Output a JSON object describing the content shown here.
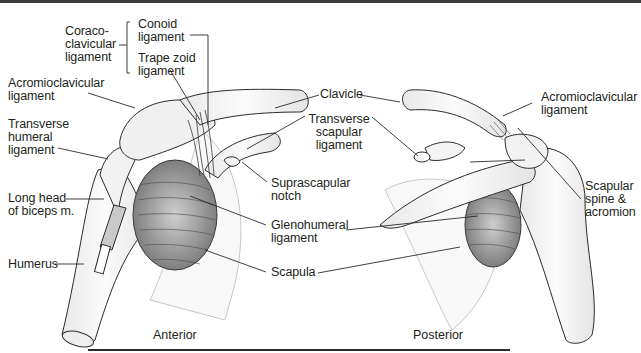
{
  "figure": {
    "views": [
      {
        "id": "anterior",
        "caption": "Anterior"
      },
      {
        "id": "posterior",
        "caption": "Posterior"
      }
    ],
    "labels": {
      "coracoclavicular": "Coraco-\nclavicular\nligament",
      "conoid": "Conoid\nligament",
      "trapezoid": "Trape zoid\nligament",
      "acromioclavicular_anterior": "Acromioclavicular\nligament",
      "transverse_humeral": "Transverse\nhumeral\nligament",
      "long_head_biceps": "Long head\nof biceps m.",
      "humerus": "Humerus",
      "clavicle": "Clavicle",
      "transverse_scapular": "Transverse\nscapular\nligament",
      "suprascapular_notch": "Suprascapular\nnotch",
      "glenohumeral": "Glenohumeral\nligament",
      "scapula": "Scapula",
      "acromioclavicular_posterior": "Acromioclavicular\nligament",
      "scapular_spine": "Scapular\nspine &\nacromion"
    },
    "colors": {
      "line": "#2b2b2b",
      "bone_fill": "#f6f6f6",
      "shade": "#9a9a9a",
      "text": "#231f20"
    }
  }
}
